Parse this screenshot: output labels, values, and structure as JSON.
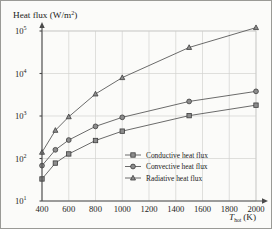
{
  "chart_data": {
    "type": "line",
    "title": "",
    "ylabel": "Heat flux (W/m",
    "ylabel_exp": "2",
    "ylabel_tail": ")",
    "xlabel_symbol": "T",
    "xlabel_sub": "hot",
    "xlabel_unit": "(K)",
    "x": [
      400,
      500,
      600,
      800,
      1000,
      1500,
      2000
    ],
    "xticks": [
      400,
      600,
      800,
      1000,
      1200,
      1400,
      1600,
      1800,
      2000
    ],
    "xlim": [
      400,
      2000
    ],
    "ylim": [
      10,
      100000
    ],
    "yticks": [
      10,
      100,
      1000,
      10000,
      100000
    ],
    "ytick_labels": [
      "10",
      "10",
      "10",
      "10",
      "10"
    ],
    "ytick_exponents": [
      "1",
      "2",
      "3",
      "4",
      "5"
    ],
    "yscale": "log",
    "grid": true,
    "legend_position": "lower right",
    "series": [
      {
        "name": "Conductive heat flux",
        "marker": "square",
        "values": [
          33,
          78,
          128,
          265,
          440,
          1020,
          1800
        ]
      },
      {
        "name": "Convective heat flux",
        "marker": "circle",
        "values": [
          68,
          160,
          272,
          570,
          930,
          2200,
          3800
        ]
      },
      {
        "name": "Radiative heat flux",
        "marker": "triangle",
        "values": [
          140,
          460,
          960,
          3300,
          8000,
          41000,
          120000
        ]
      }
    ],
    "colors": {
      "line": "#5a5a5a",
      "marker_fill": "#8c8c8c",
      "marker_edge": "#3c3c3c",
      "grid": "#d2d2d0",
      "axis": "#4a4a4a",
      "background": "#fbfbf9",
      "text": "#1b1b1b"
    }
  },
  "legend": {
    "items": [
      {
        "label": "Conductive heat flux",
        "marker": "square"
      },
      {
        "label": "Convective heat flux",
        "marker": "circle"
      },
      {
        "label": "Radiative heat flux",
        "marker": "triangle"
      }
    ]
  }
}
